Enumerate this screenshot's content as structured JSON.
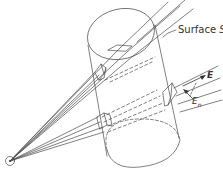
{
  "diagram": {
    "type": "gaussian-surface-illustration",
    "labels": {
      "surface_prefix": "Surface ",
      "surface_symbol": "S",
      "field": "E",
      "normal_component_base": "E",
      "normal_component_sub": "n"
    },
    "elements": {
      "point_charge": {
        "symbol": "circled-dot",
        "position": [
          10,
          161
        ]
      },
      "cylinder": {
        "top_ellipse": "solid",
        "bottom_ellipse": "partially-dashed",
        "sides": "solid"
      },
      "field_line_bundles": 4,
      "area_elements": 4,
      "arrows": [
        "E (along field line)",
        "E_n (normal component)"
      ]
    },
    "colors": {
      "line": "#4a4a4a",
      "text": "#333333",
      "background": "#ffffff"
    }
  }
}
